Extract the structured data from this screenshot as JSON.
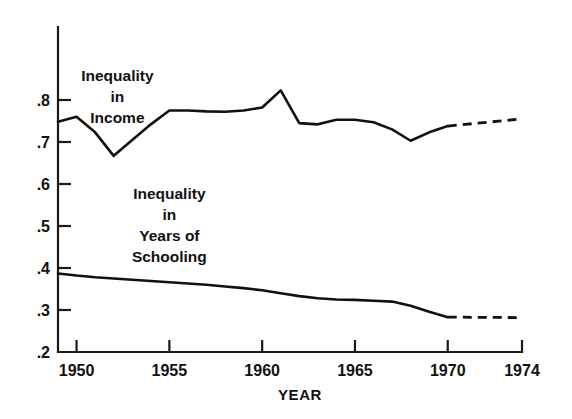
{
  "chart_data": {
    "type": "line",
    "title": "",
    "xlabel": "YEAR",
    "ylabel": "",
    "xlim": [
      1949,
      1974
    ],
    "ylim": [
      0.2,
      0.85
    ],
    "grid": false,
    "legend_position": "inline-annotations",
    "xticks": [
      1950,
      1955,
      1960,
      1965,
      1970,
      1974
    ],
    "xtick_labels": [
      "1950",
      "1955",
      "1960",
      "1965",
      "1970",
      "1974"
    ],
    "yticks": [
      0.2,
      0.3,
      0.4,
      0.5,
      0.6,
      0.7,
      0.8
    ],
    "ytick_labels": [
      ".2",
      ".3",
      ".4",
      ".5",
      ".6",
      ".7",
      ".8"
    ],
    "annotations": [
      {
        "name": "income-series-label",
        "lines": [
          "Inequality",
          "in",
          "Income"
        ],
        "x": 1952.2,
        "y": 0.845
      },
      {
        "name": "schooling-series-label",
        "lines": [
          "Inequality",
          "in",
          "Years of",
          "Schooling"
        ],
        "x": 1955.0,
        "y": 0.565
      }
    ],
    "series": [
      {
        "name": "Inequality in Income",
        "style": "solid",
        "x": [
          1949,
          1950,
          1951,
          1952,
          1953,
          1954,
          1955,
          1956,
          1957,
          1958,
          1959,
          1960,
          1961,
          1962,
          1963,
          1964,
          1965,
          1966,
          1967,
          1968,
          1969,
          1970
        ],
        "values": [
          0.748,
          0.76,
          0.723,
          0.667,
          0.705,
          0.742,
          0.775,
          0.775,
          0.773,
          0.772,
          0.775,
          0.782,
          0.823,
          0.745,
          0.742,
          0.753,
          0.753,
          0.747,
          0.73,
          0.703,
          0.723,
          0.738
        ]
      },
      {
        "name": "Inequality in Income (projected)",
        "style": "dashed",
        "x": [
          1970,
          1974
        ],
        "values": [
          0.738,
          0.755
        ]
      },
      {
        "name": "Inequality in Years of Schooling",
        "style": "solid",
        "x": [
          1949,
          1950,
          1951,
          1952,
          1953,
          1954,
          1955,
          1956,
          1957,
          1958,
          1959,
          1960,
          1961,
          1962,
          1963,
          1964,
          1965,
          1966,
          1967,
          1968,
          1969,
          1970
        ],
        "values": [
          0.387,
          0.382,
          0.378,
          0.375,
          0.372,
          0.369,
          0.366,
          0.363,
          0.36,
          0.356,
          0.352,
          0.347,
          0.34,
          0.333,
          0.328,
          0.325,
          0.324,
          0.322,
          0.32,
          0.31,
          0.296,
          0.283
        ]
      },
      {
        "name": "Inequality in Years of Schooling (projected)",
        "style": "dashed",
        "x": [
          1970,
          1974
        ],
        "values": [
          0.283,
          0.282
        ]
      }
    ]
  },
  "figure": {
    "background_color": "#ffffff",
    "line_color": "#111111",
    "axis_color": "#1a1a1a"
  }
}
